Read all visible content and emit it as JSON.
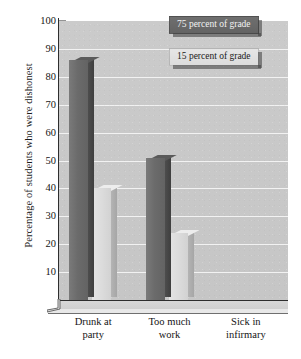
{
  "chart_data": {
    "type": "bar",
    "title": "",
    "subtitle": "",
    "xlabel": "",
    "ylabel": "Percentage of students who were dishonest",
    "categories": [
      "Drunk at party",
      "Too much work",
      "Sick in infirmary"
    ],
    "category_lines": [
      [
        "Drunk at",
        "party"
      ],
      [
        "Too much",
        "work"
      ],
      [
        "Sick in",
        "infirmary"
      ]
    ],
    "series": [
      {
        "name": "75 percent of grade",
        "values": [
          86,
          51,
          0
        ],
        "color": "#6b6b6b"
      },
      {
        "name": "15 percent of grade",
        "values": [
          40,
          24,
          0
        ],
        "color": "#dcdcdc"
      }
    ],
    "ylim": [
      0,
      100
    ],
    "yticks": [
      10,
      20,
      30,
      40,
      50,
      60,
      70,
      80,
      90,
      100
    ],
    "ytick_labels": [
      "10",
      "20",
      "30",
      "40",
      "50",
      "60",
      "70",
      "80",
      "90",
      "100"
    ],
    "grid": true,
    "grid_color": "#f2f2f2",
    "legend_position": "top-right",
    "plot_background": "#c9c9c9",
    "style": "3d-grayscale"
  },
  "legend": {
    "items": [
      {
        "label": "75 percent of grade",
        "swatch": "#6b6b6b"
      },
      {
        "label": "15 percent of grade",
        "swatch": "#dcdcdc"
      }
    ]
  },
  "axis": {
    "y_title": "Percentage of students who were dishonest"
  }
}
